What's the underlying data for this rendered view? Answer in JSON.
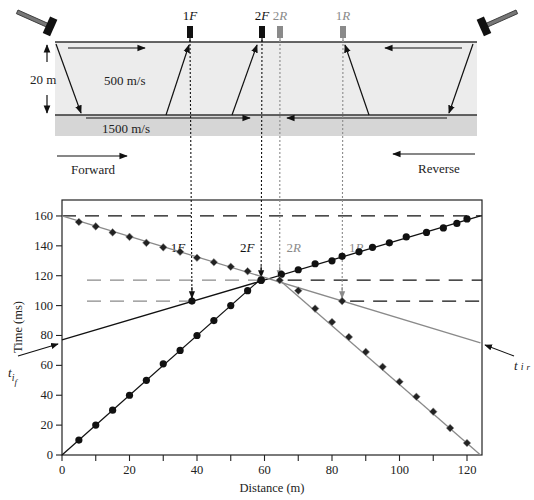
{
  "diagram": {
    "layer_thickness_label": "20 m",
    "upper_velocity_label": "500 m/s",
    "lower_velocity_label": "1500 m/s",
    "forward_label": "Forward",
    "reverse_label": "Reverse",
    "geophones": [
      {
        "id": "1F",
        "num": "1",
        "letter": "F",
        "distance_m": 38.5,
        "arrival_ms": 103,
        "color": "#111111",
        "shot": "forward"
      },
      {
        "id": "2F",
        "num": "2",
        "letter": "F",
        "distance_m": 59,
        "arrival_ms": 117,
        "color": "#111111",
        "shot": "forward"
      },
      {
        "id": "2R",
        "num": "2",
        "letter": "R",
        "distance_m": 64.5,
        "arrival_ms": 117,
        "color": "#8a8a8a",
        "shot": "reverse"
      },
      {
        "id": "1R",
        "num": "1",
        "letter": "R",
        "distance_m": 83,
        "arrival_ms": 103,
        "color": "#8a8a8a",
        "shot": "reverse"
      }
    ],
    "colors": {
      "upper_layer": "#ececec",
      "lower_layer": "#d6d6d6",
      "forward": "#111111",
      "reverse": "#8a8a8a"
    }
  },
  "chart_data": {
    "type": "scatter",
    "title": "",
    "xlabel": "Distance (m)",
    "ylabel": "Time (ms)",
    "xlim": [
      0,
      124
    ],
    "ylim": [
      0,
      170
    ],
    "xticks": [
      0,
      20,
      40,
      60,
      80,
      100,
      120
    ],
    "xminor": [
      10,
      30,
      50,
      70,
      90,
      110
    ],
    "yticks": [
      0,
      20,
      40,
      60,
      80,
      100,
      120,
      140,
      160
    ],
    "grid": false,
    "intercept_labels": {
      "forward": {
        "t": "t",
        "sub": "i",
        "subsub": "f",
        "value_ms": 77
      },
      "reverse": {
        "t": "t",
        "sub": "i",
        "subsub": "r",
        "value_ms": 75
      }
    },
    "reference_lines_ms": [
      {
        "value": 160,
        "color": "#111111"
      },
      {
        "value": 117,
        "color": "#111111"
      },
      {
        "value": 103,
        "color": "#111111"
      }
    ],
    "series": [
      {
        "name": "Forward direct",
        "marker": "circle",
        "color": "#111111",
        "line": [
          [
            0,
            0
          ],
          [
            59,
            118
          ]
        ],
        "points": [
          [
            5,
            10
          ],
          [
            10,
            20
          ],
          [
            15,
            30
          ],
          [
            20,
            40
          ],
          [
            25,
            50
          ],
          [
            30,
            61
          ],
          [
            35,
            70
          ],
          [
            40,
            80
          ],
          [
            45,
            90
          ],
          [
            50,
            100
          ],
          [
            55,
            110
          ],
          [
            59,
            117
          ]
        ]
      },
      {
        "name": "Forward refracted",
        "marker": "circle",
        "color": "#111111",
        "line": [
          [
            0,
            77
          ],
          [
            124,
            160
          ]
        ],
        "points": [
          [
            38.5,
            103
          ],
          [
            59,
            117
          ],
          [
            65,
            121
          ],
          [
            70,
            124
          ],
          [
            75,
            128
          ],
          [
            80,
            130
          ],
          [
            83,
            133
          ],
          [
            88,
            136
          ],
          [
            92,
            139
          ],
          [
            97,
            142
          ],
          [
            102,
            146
          ],
          [
            108,
            149
          ],
          [
            113,
            152
          ],
          [
            117,
            155
          ],
          [
            120,
            158
          ]
        ]
      },
      {
        "name": "Reverse direct",
        "marker": "diamond",
        "color": "#8a8a8a",
        "line": [
          [
            124,
            0
          ],
          [
            64.5,
            117
          ]
        ],
        "points": [
          [
            120,
            8
          ],
          [
            115,
            18
          ],
          [
            110,
            29
          ],
          [
            105,
            39
          ],
          [
            100,
            49
          ],
          [
            95,
            59
          ],
          [
            90,
            69
          ],
          [
            85,
            79
          ],
          [
            80,
            89
          ],
          [
            75,
            98
          ],
          [
            70,
            110
          ]
        ]
      },
      {
        "name": "Reverse refracted",
        "marker": "diamond",
        "color": "#8a8a8a",
        "line": [
          [
            0,
            160
          ],
          [
            124,
            75
          ]
        ],
        "points": [
          [
            5,
            156
          ],
          [
            10,
            153
          ],
          [
            15,
            149
          ],
          [
            20,
            146
          ],
          [
            25,
            142
          ],
          [
            30,
            139
          ],
          [
            35,
            136
          ],
          [
            40,
            132
          ],
          [
            45,
            129
          ],
          [
            50,
            126
          ],
          [
            55,
            123
          ],
          [
            64.5,
            117
          ],
          [
            83,
            103
          ]
        ]
      }
    ]
  }
}
